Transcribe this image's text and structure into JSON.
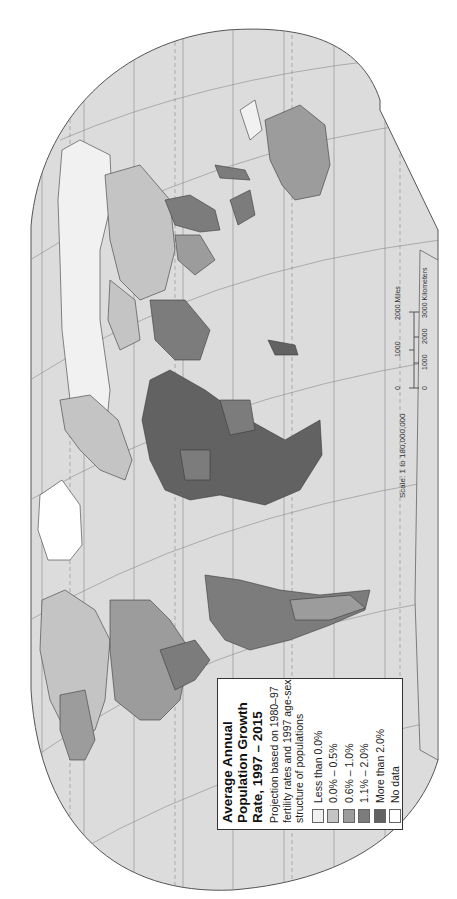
{
  "map": {
    "orientation": "rotated 90deg counter-clockwise (north to the left)",
    "colors": {
      "ocean": "#dcdcdc",
      "background": "#ffffff",
      "graticule": "#8a8a8a",
      "border": "#3a3a3a"
    }
  },
  "legend": {
    "title_line1": "Average Annual",
    "title_line2": "Population Growth",
    "title_line3": "Rate, 1997 – 2015",
    "subtitle_line1": "Projection based on 1980–97",
    "subtitle_line2": "fertility rates and 1997 age-sex",
    "subtitle_line3": "structure of populations",
    "items": [
      {
        "label": "Less than 0.0%",
        "color": "#f1f1f1"
      },
      {
        "label": "0.0% – 0.5%",
        "color": "#c4c4c4"
      },
      {
        "label": "0.6% – 1.0%",
        "color": "#9c9c9c"
      },
      {
        "label": "1.1% – 2.0%",
        "color": "#7c7c7c"
      },
      {
        "label": "More than 2.0%",
        "color": "#626262"
      },
      {
        "label": "No data",
        "color": "#ffffff"
      }
    ]
  },
  "scale": {
    "text": "Scale: 1 to 180,000,000",
    "miles_ticks": [
      "0",
      "1000",
      "2000 Miles"
    ],
    "km_ticks": [
      "0",
      "1000",
      "2000",
      "3000 Kilometers"
    ]
  }
}
